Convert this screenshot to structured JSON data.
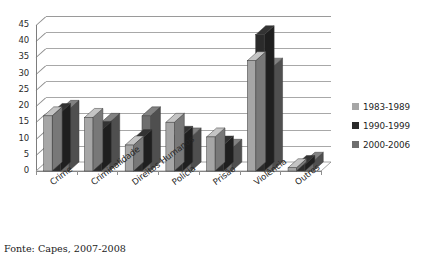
{
  "caption": "Fonte: Capes, 2007-2008",
  "legend": {
    "position": "right",
    "items": [
      {
        "label": "1983-1989",
        "color": "#a6a6a6"
      },
      {
        "label": "1990-1999",
        "color": "#2b2b2b"
      },
      {
        "label": "2000-2006",
        "color": "#6e6e6e"
      }
    ]
  },
  "axis": {
    "y_ticks": [
      "0",
      "5",
      "10",
      "15",
      "20",
      "25",
      "30",
      "35",
      "40",
      "45"
    ]
  },
  "chart_data": {
    "type": "bar",
    "title": "",
    "xlabel": "",
    "ylabel": "",
    "ylim": [
      0,
      45
    ],
    "ytick_step": 5,
    "grid": true,
    "legend_position": "right",
    "style": "3d-perspective-clustered-column",
    "categories": [
      "Crime",
      "Criminalidade",
      "Direitos Humanos",
      "Polícia",
      "Prisão",
      "Violência",
      "Outros"
    ],
    "series": [
      {
        "name": "1983-1989",
        "color": "#a6a6a6",
        "values": [
          17,
          16.5,
          8,
          15,
          10.5,
          34,
          1
        ]
      },
      {
        "name": "1990-1999",
        "color": "#2b2b2b",
        "values": [
          18,
          12.5,
          10,
          11,
          8,
          42,
          2
        ]
      },
      {
        "name": "2000-2006",
        "color": "#6e6e6e",
        "values": [
          19,
          15,
          17,
          10.5,
          7,
          32,
          3
        ]
      }
    ]
  }
}
